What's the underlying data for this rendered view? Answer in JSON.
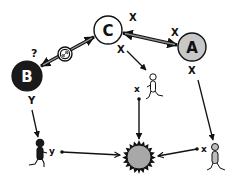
{
  "diagram": {
    "nodes": {
      "C": {
        "label": "C",
        "fill": "#ffffff",
        "text_color": "#111111"
      },
      "A": {
        "label": "A",
        "fill": "#c8c8c8",
        "text_color": "#111111"
      },
      "B": {
        "label": "B",
        "fill": "#1a1a1a",
        "text_color": "#ffffff"
      }
    },
    "edge_labels": {
      "c_right_x": "X",
      "a_left_x": "X",
      "c_below_x": "X",
      "a_below_x": "X",
      "b_question": "?",
      "b_below_y": "Y"
    },
    "runners": {
      "center": {
        "label": "x",
        "fill": "#ffffff"
      },
      "left": {
        "label": "y",
        "fill": "#1a1a1a"
      },
      "right": {
        "label": "x",
        "fill": "#bdbdbd"
      }
    },
    "icons": {
      "inhibition": "blocked-interaction-icon",
      "target": "spiky-cell-target-icon"
    },
    "colors": {
      "stroke": "#111111",
      "gray_node": "#c8c8c8",
      "dark_node": "#1a1a1a",
      "target_fill": "#a8a8a8",
      "link_gray": "#808080"
    }
  }
}
